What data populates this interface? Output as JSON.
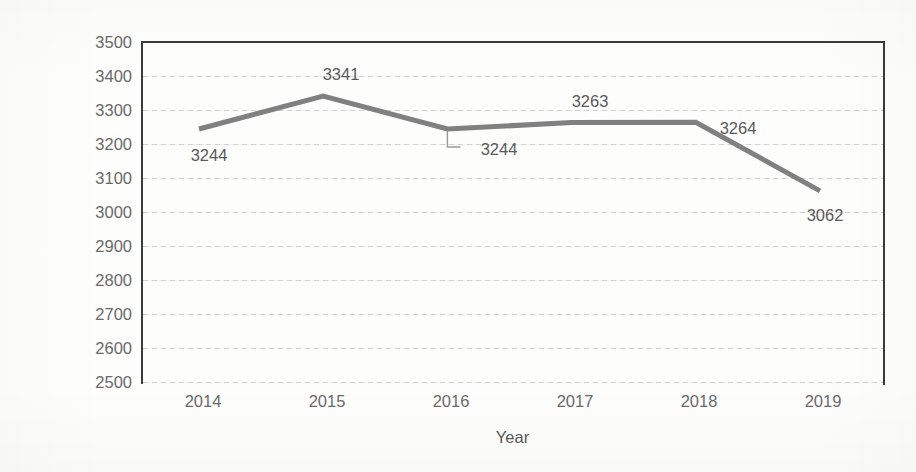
{
  "chart_data": {
    "type": "line",
    "title": "",
    "xlabel": "Year",
    "ylabel": "Number of casualties & incidents",
    "categories": [
      "2014",
      "2015",
      "2016",
      "2017",
      "2018",
      "2019"
    ],
    "values": [
      3244,
      3341,
      3244,
      3263,
      3264,
      3062
    ],
    "series": [
      {
        "name": "Number of casualties & incidents",
        "values": [
          3244,
          3341,
          3244,
          3263,
          3264,
          3062
        ],
        "color": "#808080"
      }
    ],
    "ylim": [
      2500,
      3500
    ],
    "ytick_step": 100,
    "yticks": [
      3500,
      3400,
      3300,
      3200,
      3100,
      3000,
      2900,
      2800,
      2700,
      2600,
      2500
    ],
    "ytick_labels": [
      "3500",
      "3400",
      "3300",
      "3200",
      "3100",
      "3000",
      "2900",
      "2800",
      "2700",
      "2600",
      "2500"
    ],
    "xticks": [
      "2014",
      "2015",
      "2016",
      "2017",
      "2018",
      "2019"
    ],
    "grid": true,
    "grid_axis": "y",
    "legend": false,
    "legend_position": "none",
    "data_labels": [
      {
        "text": "3244",
        "value": 3244,
        "category": "2014",
        "position": "below-right"
      },
      {
        "text": "3341",
        "value": 3341,
        "category": "2015",
        "position": "above"
      },
      {
        "text": "3244",
        "value": 3244,
        "category": "2016",
        "position": "below-right-leader"
      },
      {
        "text": "3263",
        "value": 3263,
        "category": "2017",
        "position": "above"
      },
      {
        "text": "3264",
        "value": 3264,
        "category": "2018",
        "position": "above-right"
      },
      {
        "text": "3062",
        "value": 3062,
        "category": "2019",
        "position": "below-left"
      }
    ],
    "colors": {
      "line": "#808080",
      "axis": "#3a3a3a",
      "grid": "#c8c8c8",
      "text": "#5a5a5a",
      "background": "#fdfdfc"
    }
  }
}
